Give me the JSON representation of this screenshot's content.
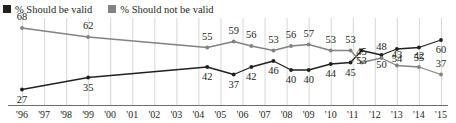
{
  "legend": {
    "items": [
      {
        "label": "% Should be valid",
        "color": "#231f20",
        "icon": "square-marker-black"
      },
      {
        "label": "% Should not be valid",
        "color": "#808285",
        "icon": "square-marker-gray"
      }
    ]
  },
  "axis": {
    "ticks": [
      "'96",
      "'97",
      "'98",
      "'99",
      "'00",
      "'01",
      "'02",
      "'03",
      "'04",
      "'05",
      "'06",
      "'07",
      "'08",
      "'09",
      "'10",
      "'11",
      "'12",
      "'13",
      "'14",
      "'15"
    ]
  },
  "chart_data": {
    "type": "line",
    "title": "",
    "subtitle": "",
    "xlabel": "",
    "ylabel": "",
    "ylim": [
      20,
      72
    ],
    "xlim": [
      1996,
      2015.5
    ],
    "grid": "vertical-only",
    "legend_position": "top-left",
    "x": [
      1996,
      1999,
      2004.4,
      2005.6,
      2006.4,
      2007.4,
      2008.2,
      2009,
      2010,
      2010.9,
      2011.4,
      2012.3,
      2013,
      2014,
      2015
    ],
    "tick_years": [
      1996,
      1997,
      1998,
      1999,
      2000,
      2001,
      2002,
      2003,
      2004,
      2005,
      2006,
      2007,
      2008,
      2009,
      2010,
      2011,
      2012,
      2013,
      2014,
      2015
    ],
    "series": [
      {
        "name": "% Should be valid",
        "color": "#231f20",
        "marker": "circle-filled-black",
        "values": [
          27,
          35,
          42,
          37,
          42,
          46,
          40,
          40,
          44,
          45,
          53,
          50,
          54,
          55,
          60
        ],
        "labels": [
          "27",
          "35",
          "42",
          "37",
          "42",
          "46",
          "40",
          "40",
          "44",
          "45",
          "53",
          "50",
          "54",
          "55",
          "60"
        ],
        "label_position": "below"
      },
      {
        "name": "% Should not be valid",
        "color": "#808285",
        "marker": "circle-filled-gray",
        "values": [
          68,
          62,
          55,
          59,
          56,
          53,
          56,
          57,
          53,
          53,
          45,
          48,
          43,
          42,
          37
        ],
        "labels": [
          "68",
          "62",
          "55",
          "59",
          "56",
          "53",
          "56",
          "57",
          "53",
          "53",
          "45",
          "48",
          "43",
          "42",
          "37"
        ],
        "label_position": "above"
      }
    ]
  }
}
